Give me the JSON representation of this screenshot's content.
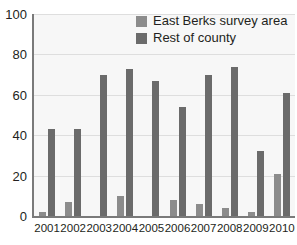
{
  "chart_data": {
    "type": "bar",
    "title": "",
    "xlabel": "",
    "ylabel": "",
    "ylim": [
      0,
      100
    ],
    "yticks": [
      0,
      20,
      40,
      60,
      80,
      100
    ],
    "grid": true,
    "legend_position": "top-center",
    "categories": [
      "2001",
      "2002",
      "2003",
      "2004",
      "2005",
      "2006",
      "2007",
      "2008",
      "2009",
      "2010"
    ],
    "series": [
      {
        "name": "East Berks survey area",
        "color": "#8c8c8c",
        "values": [
          2,
          7,
          0,
          10,
          0,
          8,
          6,
          4,
          2,
          21
        ]
      },
      {
        "name": "Rest of county",
        "color": "#6b6b6b",
        "values": [
          43,
          43,
          70,
          73,
          67,
          54,
          70,
          74,
          32,
          61
        ]
      }
    ]
  },
  "axis": {
    "y_tick_labels": [
      "100",
      "80",
      "60",
      "40",
      "20",
      "0"
    ]
  }
}
